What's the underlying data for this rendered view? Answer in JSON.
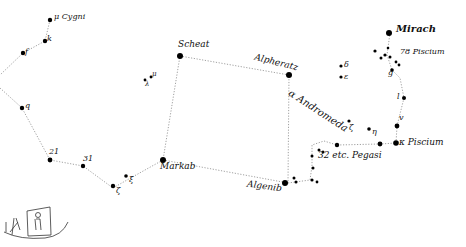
{
  "colors": {
    "ink": "#111111",
    "line": "#777777",
    "background": "#ffffff"
  },
  "labels": {
    "mu_cygni": "μ Cygni",
    "k": "k",
    "f": "f",
    "q": "q",
    "n21": "21",
    "n31": "31",
    "zeta": "ζ",
    "xi": "ξ",
    "markab": "Markab",
    "scheat": "Scheat",
    "mu": "μ",
    "lambda": "λ",
    "alpheratz": "Alpheratz",
    "andromeda": "α Andromeda",
    "delta": "δ",
    "epsilon": "ε",
    "zeta2": "ζ",
    "eta": "η",
    "algenib": "Algenib",
    "pegasi32": "32 etc. Pegasi",
    "kappa_piscium": "κ Piscium",
    "mirach": "Mirach",
    "piscium78": "78 Piscium",
    "g": "g",
    "l": "l",
    "v": "v"
  }
}
